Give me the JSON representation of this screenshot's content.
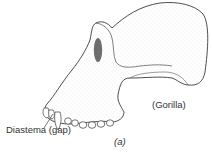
{
  "figure": {
    "labels": {
      "diastema": "Diastema (gap)",
      "species": "(Gorilla)",
      "panel": "(a)"
    },
    "colors": {
      "line": "#3a3a3a",
      "stipple": "#9a9a9a",
      "orbit_fill": "#555555",
      "text": "#333333",
      "background": "#ffffff"
    }
  }
}
